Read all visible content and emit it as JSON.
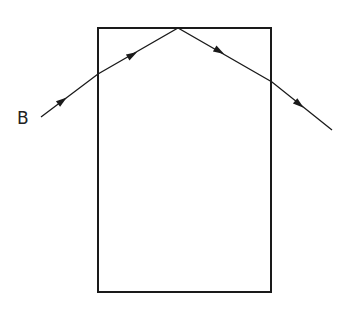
{
  "diagram": {
    "ray_label": "B",
    "colors": {
      "stroke": "#1a1a1a",
      "background": "#ffffff"
    },
    "block": {
      "x": 98,
      "y": 28,
      "width": 173,
      "height": 264
    },
    "ray_points": [
      [
        41,
        117
      ],
      [
        98,
        74
      ],
      [
        178,
        28
      ],
      [
        272,
        82
      ],
      [
        332,
        130
      ]
    ],
    "arrows": [
      {
        "x": 62,
        "y": 101,
        "angle": -37
      },
      {
        "x": 132,
        "y": 55,
        "angle": -30
      },
      {
        "x": 219,
        "y": 51,
        "angle": 30
      },
      {
        "x": 299,
        "y": 104,
        "angle": 39
      }
    ]
  }
}
